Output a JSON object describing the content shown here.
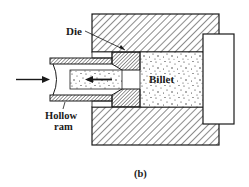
{
  "figure": {
    "caption": "(b)",
    "labels": {
      "die": "Die",
      "billet": "Billet",
      "hollow_ram_line1": "Hollow",
      "hollow_ram_line2": "ram"
    },
    "colors": {
      "ink": "#1a1a1a",
      "background": "#ffffff"
    }
  }
}
